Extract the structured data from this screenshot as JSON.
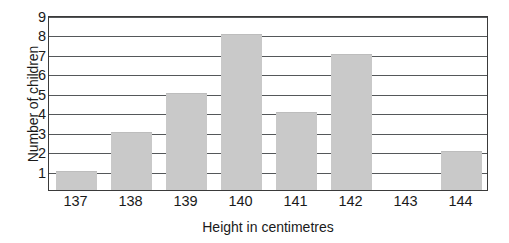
{
  "chart_data": {
    "type": "bar",
    "title": "",
    "xlabel": "Height in centimetres",
    "ylabel": "Number of children",
    "categories": [
      "137",
      "138",
      "139",
      "140",
      "141",
      "142",
      "143",
      "144"
    ],
    "values": [
      1,
      3,
      5,
      8,
      4,
      7,
      0,
      2
    ],
    "ylim": [
      0,
      9
    ],
    "yticks": [
      "9",
      "8",
      "7",
      "6",
      "5",
      "4",
      "3",
      "2",
      "1"
    ],
    "ytick_values": [
      9,
      8,
      7,
      6,
      5,
      4,
      3,
      2,
      1
    ],
    "grid": true,
    "legend": false,
    "legend_position": "none",
    "colors": {
      "bar_fill": "#c9c9c9",
      "gridline": "#55585a",
      "frame": "#3a3a3a",
      "background": "#ffffff",
      "text": "#1a1a1a"
    }
  }
}
